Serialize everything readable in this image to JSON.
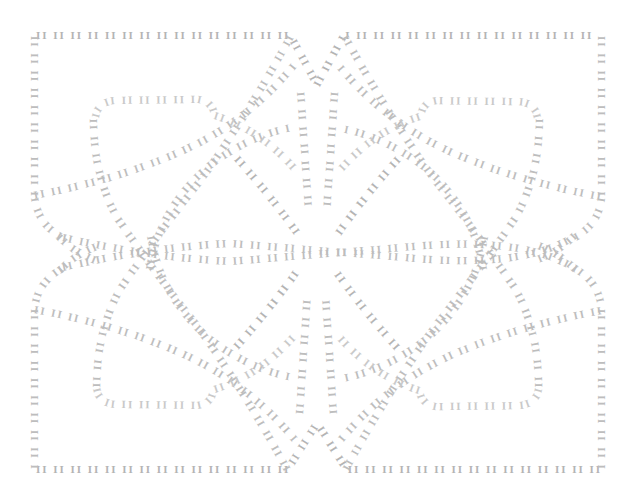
{
  "canvas": {
    "name": "text-path-knot-pattern",
    "width": 634,
    "height": 504,
    "background_color": "#ffffff",
    "ink_color": "#bdbdbd",
    "ink_color_light": "#c9c9c9",
    "ink_color_dark": "#b4b4b4",
    "description": "Decorative four-fold symmetric interlaced knot / maze pattern drawn entirely from repeating text glyphs following curved paths."
  },
  "typography": {
    "glyph_unit": "II",
    "repeat_string": "II II II II II II II II II II II II II II II II II II II II II II II II II II II II II II II II II II II II II II II II",
    "repeat_string_short": "II II II II II II II II II II II II II II II II II II II II",
    "repeat_string_tiny": "II II II II II II II II II II",
    "font_size_px": 11,
    "font_weight": "bold",
    "letter_spacing_em": 0.18
  },
  "paths": [
    {
      "id": "outer-top",
      "label": "outer border top edge",
      "d": "M 36,36 L 290,36 L 317,86 L 344,36 L 600,36",
      "text_key": "repeat_string",
      "tone": "dense"
    },
    {
      "id": "outer-bottom",
      "label": "outer border bottom edge",
      "d": "M 36,470 L 288,470 L 317,424 L 346,470 L 600,470",
      "text_key": "repeat_string",
      "tone": "dense"
    },
    {
      "id": "outer-left-upper",
      "label": "outer border left upper edge",
      "d": "M 34,36 L 34,196 Q 36,224 62,238",
      "text_key": "repeat_string_short",
      "tone": "normal"
    },
    {
      "id": "outer-left-lower",
      "label": "outer border left lower edge",
      "d": "M 62,268 Q 36,282 34,310 L 34,470",
      "text_key": "repeat_string_short",
      "tone": "normal"
    },
    {
      "id": "outer-right-upper",
      "label": "outer border right upper edge",
      "d": "M 601,36 L 601,196 Q 599,224 573,238",
      "text_key": "repeat_string_short",
      "tone": "normal"
    },
    {
      "id": "outer-right-lower",
      "label": "outer border right lower edge",
      "d": "M 573,268 Q 599,282 601,310 L 601,470",
      "text_key": "repeat_string_short",
      "tone": "normal"
    },
    {
      "id": "diag-tl-br",
      "label": "main diagonal top-left to bottom-right",
      "d": "M 62,238 Q 150,258 230,262 L 404,248 Q 520,236 573,268",
      "text_key": "repeat_string",
      "tone": "normal"
    },
    {
      "id": "diag-bl-tr",
      "label": "main diagonal bottom-left to top-right",
      "d": "M 62,268 Q 150,248 230,244 L 404,258 Q 520,270 573,238",
      "text_key": "repeat_string",
      "tone": "normal"
    },
    {
      "id": "arc-tl-in",
      "label": "top-left inner arc descending",
      "d": "M 290,36 Q 250,110 200,180 Q 160,230 120,288 Q 96,330 96,388",
      "text_key": "repeat_string",
      "tone": "normal"
    },
    {
      "id": "arc-tr-in",
      "label": "top-right inner arc descending",
      "d": "M 344,36 Q 384,110 434,180 Q 474,230 514,288 Q 538,330 538,388",
      "text_key": "repeat_string",
      "tone": "normal"
    },
    {
      "id": "arc-bl-in",
      "label": "bottom-left inner arc ascending",
      "d": "M 288,470 Q 248,396 198,326 Q 158,276 118,218 Q 94,176 94,118",
      "text_key": "repeat_string",
      "tone": "normal"
    },
    {
      "id": "arc-br-in",
      "label": "bottom-right inner arc ascending",
      "d": "M 346,470 Q 386,396 436,326 Q 476,276 516,218 Q 540,176 540,118",
      "text_key": "repeat_string",
      "tone": "normal"
    },
    {
      "id": "loop-tl",
      "label": "top-left inner rounded loop",
      "d": "M 96,118 Q 98,102 116,101 L 196,100 Q 212,101 214,116",
      "text_key": "repeat_string_short",
      "tone": "faint"
    },
    {
      "id": "loop-tr",
      "label": "top-right inner rounded loop",
      "d": "M 538,118 Q 536,102 518,101 L 438,100 Q 422,101 420,116",
      "text_key": "repeat_string_short",
      "tone": "faint"
    },
    {
      "id": "loop-bl",
      "label": "bottom-left inner rounded loop",
      "d": "M 96,388 Q 98,404 116,405 L 196,406 Q 212,405 214,390",
      "text_key": "repeat_string_short",
      "tone": "faint"
    },
    {
      "id": "loop-br",
      "label": "bottom-right inner rounded loop",
      "d": "M 538,388 Q 536,404 518,405 L 438,406 Q 422,405 420,390",
      "text_key": "repeat_string_short",
      "tone": "faint"
    },
    {
      "id": "petal-tl",
      "label": "upper-left petal inner curve",
      "d": "M 150,270 Q 160,208 210,166 Q 250,136 292,128",
      "text_key": "repeat_string_short",
      "tone": "normal"
    },
    {
      "id": "petal-tr",
      "label": "upper-right petal inner curve",
      "d": "M 484,270 Q 474,208 424,166 Q 384,136 342,128",
      "text_key": "repeat_string_short",
      "tone": "normal"
    },
    {
      "id": "petal-bl",
      "label": "lower-left petal inner curve",
      "d": "M 150,236 Q 160,298 210,340 Q 250,370 292,378",
      "text_key": "repeat_string_short",
      "tone": "normal"
    },
    {
      "id": "petal-br",
      "label": "lower-right petal inner curve",
      "d": "M 484,236 Q 474,298 424,340 Q 384,370 342,378",
      "text_key": "repeat_string_short",
      "tone": "normal"
    },
    {
      "id": "core-tl",
      "label": "core diagonal upper-left",
      "d": "M 236,158 Q 270,196 300,238",
      "text_key": "repeat_string_tiny",
      "tone": "dense"
    },
    {
      "id": "core-tr",
      "label": "core diagonal upper-right",
      "d": "M 398,158 Q 364,196 334,238",
      "text_key": "repeat_string_tiny",
      "tone": "dense"
    },
    {
      "id": "core-bl",
      "label": "core diagonal lower-left",
      "d": "M 236,348 Q 270,310 300,268",
      "text_key": "repeat_string_tiny",
      "tone": "dense"
    },
    {
      "id": "core-br",
      "label": "core diagonal lower-right",
      "d": "M 398,348 Q 364,310 334,268",
      "text_key": "repeat_string_tiny",
      "tone": "dense"
    },
    {
      "id": "spine-top",
      "label": "central vertical spine upper",
      "d": "M 300,92 L 308,212",
      "text_key": "repeat_string_tiny",
      "tone": "normal"
    },
    {
      "id": "spine-top2",
      "label": "central vertical spine upper right",
      "d": "M 334,92 L 326,212",
      "text_key": "repeat_string_tiny",
      "tone": "normal"
    },
    {
      "id": "spine-bottom",
      "label": "central vertical spine lower",
      "d": "M 300,414 L 308,294",
      "text_key": "repeat_string_tiny",
      "tone": "normal"
    },
    {
      "id": "spine-bottom2",
      "label": "central vertical spine lower right",
      "d": "M 334,414 L 326,294",
      "text_key": "repeat_string_tiny",
      "tone": "normal"
    },
    {
      "id": "sweep-tl",
      "label": "top-left long sweep to center",
      "d": "M 34,196 Q 120,180 186,150 Q 250,120 294,66",
      "text_key": "repeat_string_short",
      "tone": "normal"
    },
    {
      "id": "sweep-tr",
      "label": "top-right long sweep to center",
      "d": "M 601,196 Q 514,180 448,150 Q 384,120 340,66",
      "text_key": "repeat_string_short",
      "tone": "normal"
    },
    {
      "id": "sweep-bl",
      "label": "bottom-left long sweep to center",
      "d": "M 34,310 Q 120,326 186,356 Q 250,386 294,440",
      "text_key": "repeat_string_short",
      "tone": "normal"
    },
    {
      "id": "sweep-br",
      "label": "bottom-right long sweep to center",
      "d": "M 601,310 Q 514,326 448,356 Q 384,386 340,440",
      "text_key": "repeat_string_short",
      "tone": "normal"
    },
    {
      "id": "bulge-tl",
      "label": "top-left outer bulge",
      "d": "M 214,116 Q 262,130 300,176",
      "text_key": "repeat_string_tiny",
      "tone": "faint"
    },
    {
      "id": "bulge-tr",
      "label": "top-right outer bulge",
      "d": "M 420,116 Q 372,130 334,176",
      "text_key": "repeat_string_tiny",
      "tone": "faint"
    },
    {
      "id": "bulge-bl",
      "label": "bottom-left outer bulge",
      "d": "M 214,390 Q 262,376 300,330",
      "text_key": "repeat_string_tiny",
      "tone": "faint"
    },
    {
      "id": "bulge-br",
      "label": "bottom-right outer bulge",
      "d": "M 420,390 Q 372,376 334,330",
      "text_key": "repeat_string_tiny",
      "tone": "faint"
    },
    {
      "id": "hook-left-up",
      "label": "left mid hook upper",
      "d": "M 96,260 Q 70,250 54,230",
      "text_key": "repeat_string_tiny",
      "tone": "normal"
    },
    {
      "id": "hook-left-dn",
      "label": "left mid hook lower",
      "d": "M 96,246 Q 70,256 54,276",
      "text_key": "repeat_string_tiny",
      "tone": "normal"
    },
    {
      "id": "hook-right-up",
      "label": "right mid hook upper",
      "d": "M 538,260 Q 564,250 580,230",
      "text_key": "repeat_string_tiny",
      "tone": "normal"
    },
    {
      "id": "hook-right-dn",
      "label": "right mid hook lower",
      "d": "M 538,246 Q 564,256 580,276",
      "text_key": "repeat_string_tiny",
      "tone": "normal"
    }
  ]
}
